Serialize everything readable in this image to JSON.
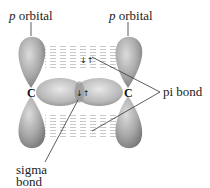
{
  "diagram": {
    "labels": {
      "p_orbital_left_italic": "p",
      "p_orbital_left_text": " orbital",
      "p_orbital_right_italic": "p",
      "p_orbital_right_text": " orbital",
      "pi_bond": "pi bond",
      "sigma_line1": "sigma",
      "sigma_line2": "bond",
      "carbon_left": "C",
      "carbon_right": "C",
      "pi_electrons": "↓↑",
      "sigma_electrons": "↓↑"
    },
    "colors": {
      "lobe_dark": "#7f7f7f",
      "lobe_light": "#d6d6d6",
      "overlap_lines": "#cccccc",
      "leader_line": "#333333"
    }
  }
}
